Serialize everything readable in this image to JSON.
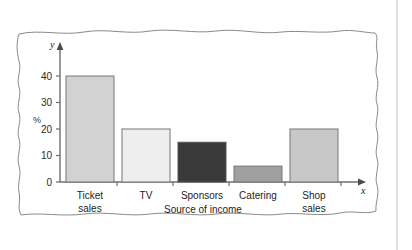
{
  "chart_data": {
    "type": "bar",
    "title": "",
    "xlabel": "Source of income",
    "ylabel": "%",
    "categories": [
      "Ticket sales",
      "TV",
      "Sponsors",
      "Catering",
      "Shop sales"
    ],
    "category_lines": [
      [
        "Ticket",
        "sales"
      ],
      [
        "TV",
        ""
      ],
      [
        "Sponsors",
        ""
      ],
      [
        "Catering",
        ""
      ],
      [
        "Shop",
        "sales"
      ]
    ],
    "values": [
      40,
      20,
      15,
      6,
      20
    ],
    "bar_colors": [
      "#d2d2d2",
      "#eeeeee",
      "#3a3a3a",
      "#a0a0a0",
      "#c8c8c8"
    ],
    "bar_edge_color": "#777777",
    "ylim": [
      0,
      44
    ],
    "yticks": [
      0,
      10,
      20,
      30,
      40
    ],
    "ytick_labels": [
      "0",
      "10",
      "20",
      "30",
      "40"
    ],
    "grid": false,
    "legend": "none",
    "axis_letters": {
      "x": "x",
      "y": "y"
    },
    "axis_color": "#6e6e6e"
  },
  "frame": {
    "style": "hand-drawn-wavy-border",
    "stroke": "#8a8a8a"
  },
  "page": {
    "background": "#ffffff",
    "divider_color": "#e2e2e2"
  }
}
